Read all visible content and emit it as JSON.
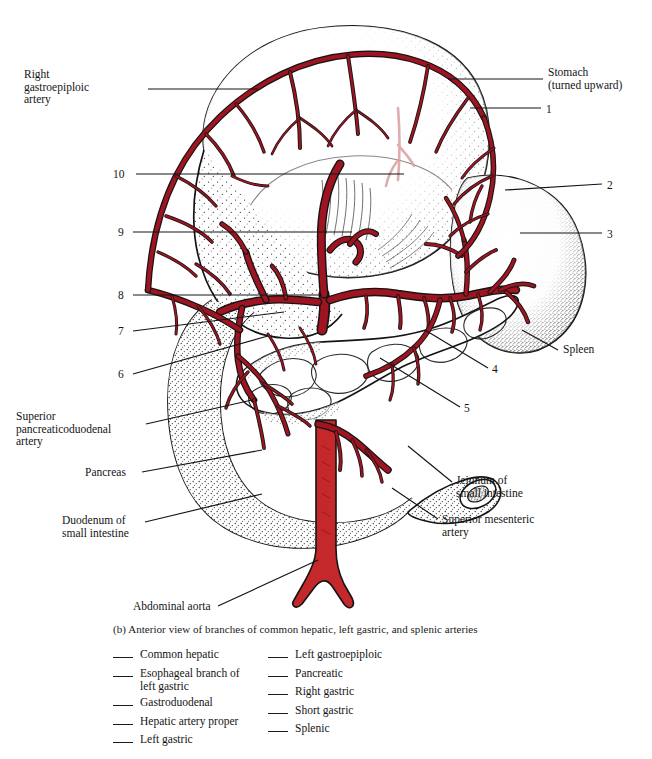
{
  "figure": {
    "caption": "(b) Anterior view of branches of common hepatic, left gastric, and splenic arteries",
    "colors": {
      "artery_fill": "#9e1420",
      "artery_fill_light": "#b3303a",
      "aorta_fill": "#c4282a",
      "outline": "#141414",
      "stipple": "#2b2b2b",
      "faded_vessel": "#d9a0a0",
      "background": "#ffffff"
    },
    "leader_labels": [
      {
        "id": "right-gastroepiploic-artery",
        "text": "Right\ngastroepiploic\nartery",
        "side": "left",
        "x": 24,
        "y": 68,
        "leader": [
          [
            148,
            89
          ],
          [
            258,
            89
          ]
        ]
      },
      {
        "id": "superior-pancreaticoduodenal-artery",
        "text": "Superior\npancreaticoduodenal\nartery",
        "side": "left",
        "x": 16,
        "y": 410,
        "leader": [
          [
            146,
            424
          ],
          [
            252,
            400
          ]
        ]
      },
      {
        "id": "pancreas",
        "text": "Pancreas",
        "side": "left",
        "x": 85,
        "y": 466,
        "leader": [
          [
            142,
            472
          ],
          [
            262,
            450
          ]
        ]
      },
      {
        "id": "duodenum-of-small-intestine",
        "text": "Duodenum of\nsmall intestine",
        "side": "left",
        "x": 62,
        "y": 514,
        "leader": [
          [
            145,
            522
          ],
          [
            262,
            494
          ]
        ]
      },
      {
        "id": "abdominal-aorta",
        "text": "Abdominal aorta",
        "side": "left",
        "x": 133,
        "y": 600,
        "leader": [
          [
            218,
            606
          ],
          [
            318,
            560
          ]
        ]
      },
      {
        "id": "stomach-turned-upward",
        "text": "Stomach\n(turned upward)",
        "side": "right",
        "x": 548,
        "y": 66,
        "leader": [
          [
            448,
            79
          ],
          [
            543,
            79
          ]
        ]
      },
      {
        "id": "spleen",
        "text": "Spleen",
        "side": "right",
        "x": 563,
        "y": 343,
        "leader": [
          [
            522,
            330
          ],
          [
            558,
            350
          ]
        ]
      },
      {
        "id": "jejunum-of-small-intestine",
        "text": "Jejunum of\nsmall intestine",
        "side": "right",
        "x": 456,
        "y": 474,
        "leader": [
          [
            408,
            446
          ],
          [
            452,
            482
          ]
        ]
      },
      {
        "id": "superior-mesenteric-artery",
        "text": "Superior mesenteric\nartery",
        "side": "right",
        "x": 442,
        "y": 513,
        "leader": [
          [
            392,
            488
          ],
          [
            438,
            519
          ]
        ]
      }
    ],
    "numbered_labels": [
      {
        "number": "1",
        "x": 546,
        "y": 103,
        "leader": [
          [
            470,
            108
          ],
          [
            541,
            108
          ]
        ]
      },
      {
        "number": "2",
        "x": 607,
        "y": 179,
        "leader": [
          [
            505,
            190
          ],
          [
            602,
            184
          ]
        ]
      },
      {
        "number": "3",
        "x": 607,
        "y": 228,
        "leader": [
          [
            520,
            233
          ],
          [
            602,
            233
          ]
        ]
      },
      {
        "number": "4",
        "x": 492,
        "y": 363,
        "leader": [
          [
            425,
            330
          ],
          [
            488,
            368
          ]
        ]
      },
      {
        "number": "5",
        "x": 464,
        "y": 402,
        "leader": [
          [
            380,
            358
          ],
          [
            460,
            407
          ]
        ]
      },
      {
        "number": "6",
        "x": 118,
        "y": 368,
        "leader": [
          [
            133,
            374
          ],
          [
            268,
            336
          ]
        ]
      },
      {
        "number": "7",
        "x": 118,
        "y": 325,
        "leader": [
          [
            133,
            331
          ],
          [
            284,
            312
          ]
        ]
      },
      {
        "number": "8",
        "x": 118,
        "y": 289,
        "leader": [
          [
            133,
            295
          ],
          [
            322,
            295
          ]
        ]
      },
      {
        "number": "9",
        "x": 118,
        "y": 226,
        "leader": [
          [
            133,
            232
          ],
          [
            352,
            232
          ]
        ]
      },
      {
        "number": "10",
        "x": 113,
        "y": 168,
        "leader": [
          [
            136,
            174
          ],
          [
            404,
            174
          ]
        ]
      }
    ]
  },
  "answer_list": {
    "left_column": [
      "Common hepatic",
      "Esophageal branch of\nleft gastric",
      "Gastroduodenal",
      "Hepatic artery proper",
      "Left gastric"
    ],
    "right_column": [
      "Left gastroepiploic",
      "Pancreatic",
      "Right gastric",
      "Short gastric",
      "Splenic"
    ]
  }
}
